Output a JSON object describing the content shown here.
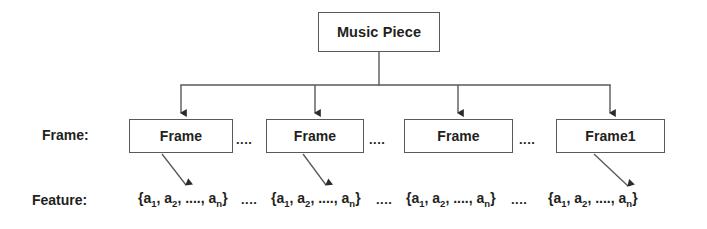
{
  "diagram": {
    "root": {
      "label": "Music Piece"
    },
    "rows": {
      "frame_label": "Frame:",
      "feature_label": "Feature:"
    },
    "frames": [
      {
        "label": "Frame"
      },
      {
        "label": "Frame"
      },
      {
        "label": "Frame"
      },
      {
        "label": "Frame1"
      }
    ],
    "ellipses": {
      "frame_gap": "....",
      "feature_gap": "...."
    },
    "features": [
      {
        "open": "{a",
        "sub1": "1",
        "sep1": ", a",
        "sub2": "2",
        "sep2": ", ...., a",
        "subn": "n",
        "close": "}"
      },
      {
        "open": "{a",
        "sub1": "1",
        "sep1": ", a",
        "sub2": "2",
        "sep2": ", ...., a",
        "subn": "n",
        "close": "}"
      },
      {
        "open": "{a",
        "sub1": "1",
        "sep1": ", a",
        "sub2": "2",
        "sep2": ", ...., a",
        "subn": "n",
        "close": "}"
      },
      {
        "open": "{a",
        "sub1": "1",
        "sep1": ", a",
        "sub2": "2",
        "sep2": ", ...., a",
        "subn": "n",
        "close": "}"
      }
    ],
    "colors": {
      "line": "#59595b",
      "text": "#231f20",
      "background": "#ffffff"
    }
  }
}
